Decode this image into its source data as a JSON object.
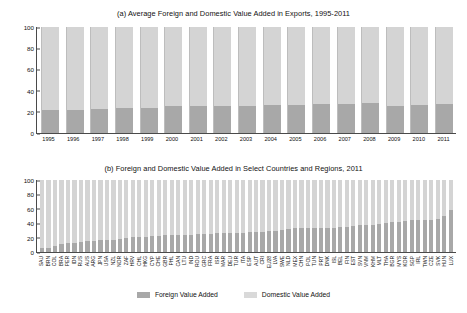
{
  "figure": {
    "legend": {
      "foreign_label": "Foreign Value Added",
      "domestic_label": "Domestic Value Added",
      "foreign_color": "#a8a8a8",
      "domestic_color": "#d9d9d9"
    }
  },
  "chart_data": [
    {
      "type": "bar",
      "id": "panel-a",
      "title": "(a) Average Foreign and Domestic Value Added in Exports, 1995-2011",
      "xlabel": "",
      "ylabel": "",
      "ylim": [
        0,
        100
      ],
      "yticks": [
        100,
        80,
        60,
        40,
        20,
        0
      ],
      "grid": false,
      "stacked": true,
      "legend_position": "bottom-shared",
      "categories": [
        "1995",
        "1996",
        "1997",
        "1998",
        "1999",
        "2000",
        "2001",
        "2002",
        "2003",
        "2004",
        "2005",
        "2006",
        "2007",
        "2008",
        "2009",
        "2010",
        "2011"
      ],
      "series": [
        {
          "name": "Foreign Value Added",
          "values": [
            21.5,
            22.0,
            22.7,
            23.6,
            23.8,
            25.5,
            25.6,
            25.1,
            25.3,
            26.2,
            26.5,
            27.2,
            27.5,
            28.6,
            25.4,
            26.4,
            27.5
          ]
        },
        {
          "name": "Domestic Value Added",
          "values": [
            78.5,
            78.0,
            77.3,
            76.4,
            76.2,
            74.5,
            74.4,
            74.9,
            74.7,
            73.8,
            73.5,
            72.8,
            72.5,
            71.4,
            74.6,
            73.6,
            72.5
          ]
        }
      ]
    },
    {
      "type": "bar",
      "id": "panel-b",
      "title": "(b) Foreign and Domestic Value Added in Select Countries and Regions, 2011",
      "xlabel": "",
      "ylabel": "",
      "ylim": [
        0,
        100
      ],
      "yticks": [
        100,
        80,
        60,
        40,
        20,
        0
      ],
      "grid": false,
      "stacked": true,
      "legend_position": "bottom",
      "categories": [
        "SAU",
        "BRN",
        "COL",
        "BRA",
        "PER",
        "IDN",
        "RUS",
        "AUS",
        "ARG",
        "JPN",
        "USA",
        "NZL",
        "NOR",
        "ZAF",
        "HRV",
        "CHL",
        "HKG",
        "CYP",
        "CHE",
        "GBR",
        "PHL",
        "CAN",
        "LTU",
        "IND",
        "ROU",
        "GRC",
        "FRA",
        "ISR",
        "MAR",
        "DEU",
        "TUR",
        "ITA",
        "ESP",
        "AUT",
        "CRI",
        "EU28",
        "LVA",
        "SWE",
        "NLD",
        "MEX",
        "CHN",
        "POL",
        "TUN",
        "PRT",
        "DNK",
        "ISL",
        "BEL",
        "FIN",
        "EST",
        "SVN",
        "VNM",
        "KHM",
        "MLT",
        "THA",
        "BGR",
        "MYS",
        "KOR",
        "SGP",
        "IRL",
        "TWN",
        "CZE",
        "SVK",
        "HUN",
        "LUX"
      ],
      "series": [
        {
          "name": "Foreign Value Added",
          "values": [
            5,
            6,
            9,
            11,
            12,
            13,
            14,
            15,
            15,
            16,
            16,
            17,
            18,
            20,
            21,
            21,
            21,
            22,
            22,
            23,
            23,
            24,
            24,
            24,
            25,
            25,
            25,
            26,
            26,
            27,
            27,
            27,
            28,
            28,
            28,
            29,
            29,
            30,
            32,
            33,
            33,
            33,
            34,
            34,
            34,
            34,
            35,
            35,
            36,
            37,
            37,
            38,
            39,
            40,
            41,
            42,
            43,
            44,
            44,
            45,
            45,
            46,
            50,
            59
          ]
        },
        {
          "name": "Domestic Value Added",
          "values": [
            95,
            94,
            91,
            89,
            88,
            87,
            86,
            85,
            85,
            84,
            84,
            83,
            82,
            80,
            79,
            79,
            79,
            78,
            78,
            77,
            77,
            76,
            76,
            76,
            75,
            75,
            75,
            74,
            74,
            73,
            73,
            73,
            72,
            72,
            72,
            71,
            71,
            70,
            68,
            67,
            67,
            67,
            66,
            66,
            66,
            66,
            65,
            65,
            64,
            63,
            63,
            62,
            61,
            60,
            59,
            58,
            57,
            56,
            56,
            55,
            55,
            54,
            50,
            41
          ]
        }
      ]
    }
  ]
}
